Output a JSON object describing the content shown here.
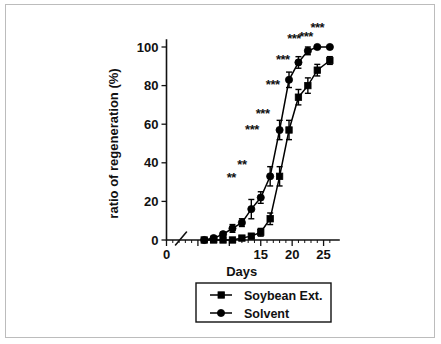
{
  "figure": {
    "caption_none": "",
    "border_color": "#bcbcbc",
    "background": "#ffffff"
  },
  "chart_data": {
    "type": "line",
    "title": "",
    "subtitle": "",
    "xlabel": "Days",
    "ylabel": "ratio of regeneration (%)",
    "xlim": [
      0,
      26.5
    ],
    "ylim": [
      0,
      105
    ],
    "grid": false,
    "legend_position": "below-plot",
    "axis_break": true,
    "axis_break_note": "diagonal break mark on x-axis between 0 and first data point",
    "xticks": [
      0,
      5,
      10,
      15,
      20,
      25
    ],
    "xtick_labels": [
      "0",
      "5",
      "10",
      "15",
      "20",
      "25"
    ],
    "xtick_labels_visible": [
      "0",
      "15",
      "20",
      "25"
    ],
    "yticks": [
      0,
      20,
      40,
      60,
      80,
      100
    ],
    "ytick_labels": [
      "0",
      "20",
      "40",
      "60",
      "80",
      "100"
    ],
    "series": [
      {
        "name": "Soybean Ext.",
        "marker": "square",
        "color": "#000000",
        "x": [
          6,
          7.5,
          9,
          10.5,
          12,
          13.5,
          15,
          16.5,
          18,
          19.5,
          21,
          22.5,
          24,
          26
        ],
        "values": [
          0,
          0,
          0,
          0,
          1,
          2,
          4,
          11,
          33,
          57,
          74,
          80,
          88,
          93
        ],
        "errors": [
          0,
          0,
          0,
          0,
          1,
          1,
          2,
          3,
          5,
          5,
          4,
          4,
          3,
          2
        ]
      },
      {
        "name": "Solvent",
        "marker": "circle",
        "color": "#000000",
        "x": [
          6,
          7.5,
          9,
          10.5,
          12,
          13.5,
          15,
          16.5,
          18,
          19.5,
          21,
          22.5,
          24,
          26
        ],
        "values": [
          0,
          1,
          3,
          6,
          9,
          16,
          22,
          33,
          57,
          83,
          92,
          98,
          100,
          100
        ],
        "errors": [
          0,
          1,
          1,
          2,
          2,
          5,
          3,
          5,
          5,
          4,
          3,
          2,
          0,
          0
        ]
      }
    ],
    "annotations": [
      {
        "label": "**",
        "x": 10.3,
        "y": 30
      },
      {
        "label": "**",
        "x": 12.0,
        "y": 37
      },
      {
        "label": "***",
        "x": 13.6,
        "y": 55
      },
      {
        "label": "***",
        "x": 15.3,
        "y": 63
      },
      {
        "label": "***",
        "x": 16.9,
        "y": 78
      },
      {
        "label": "***",
        "x": 18.5,
        "y": 91
      },
      {
        "label": "***",
        "x": 20.3,
        "y": 102
      },
      {
        "label": "***",
        "x": 22.2,
        "y": 103
      },
      {
        "label": "***",
        "x": 24.0,
        "y": 108
      }
    ]
  },
  "legend": {
    "entries": [
      {
        "label": "Soybean Ext.",
        "marker": "square"
      },
      {
        "label": "Solvent",
        "marker": "circle"
      }
    ]
  }
}
